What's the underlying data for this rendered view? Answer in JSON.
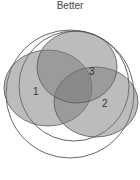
{
  "title": "Better",
  "labels": {
    "one": "1",
    "two": "2",
    "three": "3"
  },
  "colors": {
    "fill": "#8a8a8a",
    "stroke": "#555555"
  }
}
